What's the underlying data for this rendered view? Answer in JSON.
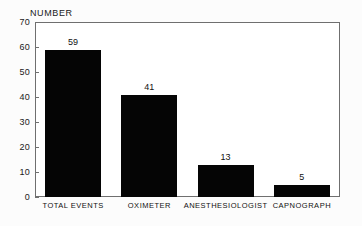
{
  "chart_data": {
    "type": "bar",
    "title": "",
    "xlabel": "",
    "ylabel": "NUMBER",
    "categories": [
      "TOTAL EVENTS",
      "OXIMETER",
      "ANESTHESIOLOGIST",
      "CAPNOGRAPH"
    ],
    "values": [
      59,
      41,
      13,
      5
    ],
    "value_labels": [
      "59",
      "41",
      "13",
      "5"
    ],
    "ylim": [
      0,
      70
    ],
    "yticks": [
      0,
      10,
      20,
      30,
      40,
      50,
      60,
      70
    ],
    "ytick_labels": [
      "0",
      "10",
      "20",
      "30",
      "40",
      "50",
      "60",
      "70"
    ],
    "grid": false,
    "legend": false,
    "bar_color": "#050505",
    "axis_color": "#6f6f6f",
    "text_color": "#111111",
    "background": "#ffffff"
  }
}
